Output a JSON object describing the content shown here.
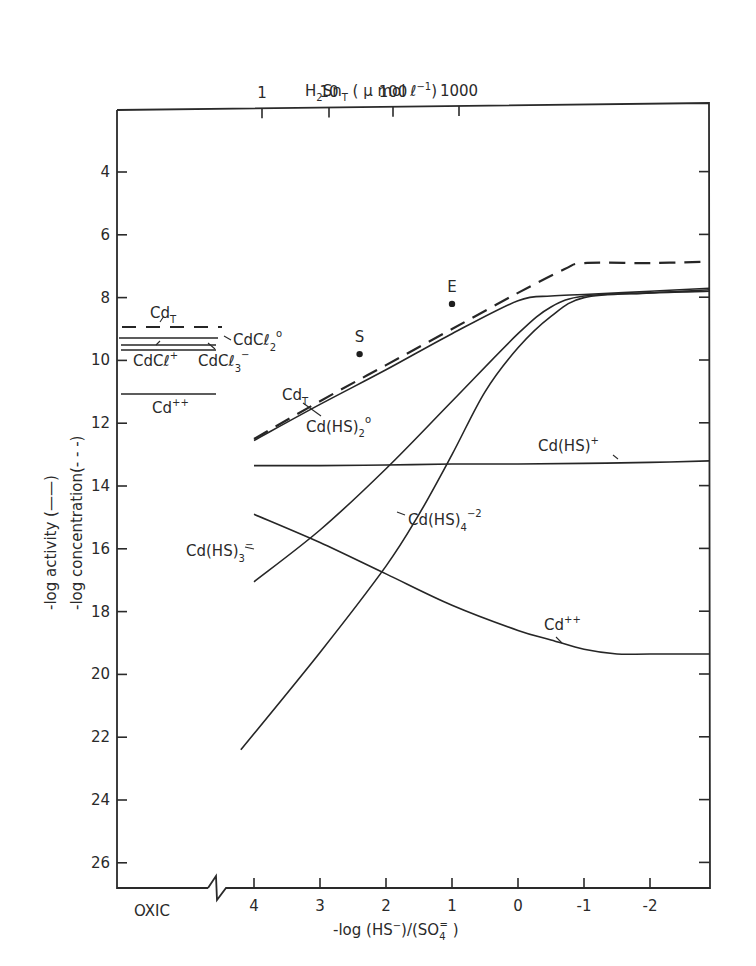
{
  "chart_data": {
    "type": "line",
    "title": "",
    "xlabel": "-log (HS⁻)/(SO₄⁼)",
    "xlabel_parts": {
      "main": "-log (HS",
      "sup1": "−",
      "mid": ")/(SO",
      "sub": "4",
      "sup2": "=",
      "end": " )"
    },
    "x_top_label": "H₂Sn_T (μ mol ℓ⁻¹)",
    "x_top_label_parts": {
      "a": "H",
      "sub1": "2",
      "b": "Sn",
      "sub2": "T",
      "c": " ( μ mol ℓ",
      "sup": "−1",
      "d": ")"
    },
    "ylabel_activity": "-log activity (——)",
    "ylabel_concentration": "-log concentration(- - -)",
    "x_ticks": [
      "4",
      "3",
      "2",
      "1",
      "0",
      "-1",
      "-2"
    ],
    "x_tick_values": [
      4,
      3,
      2,
      1,
      0,
      -1,
      -2
    ],
    "x_oxic_label": "OXIC",
    "x_top_ticks": [
      "1",
      "10",
      "100",
      "1000"
    ],
    "x_top_tick_positions_xlog": [
      4.0,
      3.0,
      2.1,
      1.1
    ],
    "y_ticks": [
      "4",
      "6",
      "8",
      "10",
      "12",
      "14",
      "16",
      "18",
      "20",
      "22",
      "24",
      "26"
    ],
    "y_tick_values": [
      4,
      6,
      8,
      10,
      12,
      14,
      16,
      18,
      20,
      22,
      24,
      26
    ],
    "ylim": [
      27,
      2
    ],
    "xlim": [
      4.2,
      -2.9
    ],
    "y_inverted": true,
    "grid": false,
    "legend": "inline labels",
    "oxic_region": {
      "lines": [
        {
          "name": "Cd_T",
          "style": "dashed",
          "y": 8.9
        },
        {
          "name": "CdCl2°",
          "style": "solid",
          "y": 9.35
        },
        {
          "name": "CdCl+",
          "style": "solid",
          "y": 9.55
        },
        {
          "name": "CdCl3-",
          "style": "solid",
          "y": 9.7
        },
        {
          "name": "Cd++",
          "style": "solid",
          "y": 11.1
        }
      ]
    },
    "series": [
      {
        "name": "Cd_T (total concentration)",
        "style": "dashed",
        "x": [
          4.0,
          3.0,
          2.0,
          1.0,
          0.0,
          -0.7,
          -1.0,
          -2.0,
          -2.9
        ],
        "y": [
          12.5,
          11.3,
          10.15,
          9.0,
          7.85,
          7.1,
          6.9,
          6.9,
          6.85
        ]
      },
      {
        "name": "Cd(HS)2°",
        "style": "solid",
        "x": [
          4.0,
          3.0,
          2.0,
          1.0,
          0.0,
          -0.5,
          -1.0,
          -2.0,
          -2.9
        ],
        "y": [
          12.55,
          11.4,
          10.3,
          9.15,
          8.1,
          7.95,
          7.9,
          7.8,
          7.7
        ]
      },
      {
        "name": "Cd(HS)+",
        "style": "solid",
        "x": [
          4.0,
          3.0,
          2.0,
          1.0,
          0.0,
          -1.0,
          -2.0,
          -2.9
        ],
        "y": [
          13.35,
          13.35,
          13.33,
          13.3,
          13.3,
          13.28,
          13.25,
          13.2
        ]
      },
      {
        "name": "Cd(HS)3-",
        "style": "solid",
        "x": [
          4.0,
          3.0,
          2.0,
          1.0,
          0.0,
          -0.5,
          -1.0,
          -2.0,
          -2.9
        ],
        "y": [
          17.05,
          15.4,
          13.45,
          11.3,
          9.15,
          8.3,
          7.95,
          7.85,
          7.8
        ]
      },
      {
        "name": "Cd(HS)4-2",
        "style": "solid",
        "x": [
          4.2,
          3.0,
          2.0,
          1.5,
          1.0,
          0.5,
          0.0,
          -0.5,
          -1.0,
          -2.0,
          -2.9
        ],
        "y": [
          22.4,
          19.3,
          16.55,
          14.9,
          13.0,
          11.0,
          9.6,
          8.6,
          8.0,
          7.85,
          7.75
        ]
      },
      {
        "name": "Cd++",
        "style": "solid",
        "x": [
          4.0,
          3.0,
          2.0,
          1.0,
          0.0,
          -0.5,
          -1.0,
          -1.5,
          -2.0,
          -2.9
        ],
        "y": [
          14.9,
          15.8,
          16.8,
          17.8,
          18.6,
          18.9,
          19.2,
          19.35,
          19.35,
          19.35
        ]
      }
    ],
    "points": [
      {
        "label": "S",
        "x": 2.4,
        "y": 9.8
      },
      {
        "label": "E",
        "x": 1.0,
        "y": 8.2
      }
    ]
  },
  "labels": {
    "cdT_oxic": {
      "main": "Cd",
      "sub": "T"
    },
    "cdcl2": {
      "main": "CdCℓ",
      "sub": "2",
      "sup": "o"
    },
    "cdcl": {
      "main": "CdCℓ",
      "sup": "+"
    },
    "cdcl3": {
      "main": "CdCℓ",
      "sub": "3",
      "sup": "−"
    },
    "cd_oxic": {
      "main": "Cd",
      "sup": "++"
    },
    "cdT_main": {
      "main": "Cd",
      "sub": "T"
    },
    "cdhs2": {
      "main": "Cd(HS)",
      "sub": "2",
      "sup": "o"
    },
    "cdhs": {
      "main": "Cd(HS)",
      "sup": "+"
    },
    "cdhs3": {
      "main": "Cd(HS)",
      "sub": "3",
      "sup": "−"
    },
    "cdhs4": {
      "main": "Cd(HS)",
      "sub": "4",
      "sup": "−2"
    },
    "cd_main": {
      "main": "Cd",
      "sup": "++"
    },
    "point_S": "S",
    "point_E": "E"
  }
}
